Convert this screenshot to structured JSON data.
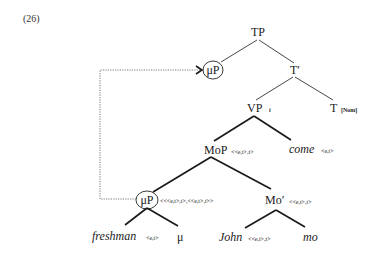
{
  "example_number": "(26)",
  "tree": {
    "tp": {
      "label": "TP"
    },
    "mup_top": {
      "label": "μP",
      "circled": true
    },
    "t_bar": {
      "label": "T′"
    },
    "vp": {
      "label": "VP",
      "subscript": "t"
    },
    "t": {
      "label": "T",
      "feature": "[Nom]"
    },
    "mop": {
      "label": "MoP",
      "type": "<<e,t>,t>"
    },
    "come": {
      "label": "come",
      "type": "<e,t>"
    },
    "mup_low": {
      "label": "μP",
      "circled": true,
      "type": "<<<e,t>,t>,<<e,t>,t>>"
    },
    "mo_bar": {
      "label": "Mo′",
      "type": "<<e,t>,t>"
    },
    "freshman": {
      "label": "freshman",
      "type": "<e,t>"
    },
    "mu": {
      "label": "μ"
    },
    "john": {
      "label": "John",
      "type": "<<e,t>,t>"
    },
    "mo": {
      "label": "mo"
    }
  },
  "movement_arrow": {
    "from": "mup_low",
    "to": "mup_top",
    "style": "dotted"
  },
  "colors": {
    "ink": "#1a1a1a",
    "background": "#ffffff"
  }
}
